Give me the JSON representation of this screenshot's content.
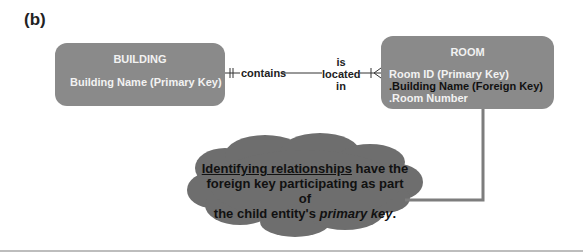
{
  "figure_label": "(b)",
  "entities": {
    "building": {
      "title": "BUILDING",
      "attributes": [
        "Building Name (Primary Key)"
      ]
    },
    "room": {
      "title": "ROOM",
      "attributes": [
        "Room ID (Primary Key)",
        ".Building Name (Foreign Key)",
        ".Room Number"
      ]
    }
  },
  "relationship": {
    "forward_label": "contains",
    "reverse_label_lines": [
      "is",
      "located",
      "in"
    ],
    "building_cardinality": "one-and-only-one",
    "room_cardinality": "one-or-many"
  },
  "callout": {
    "underlined": "Identifying relationships",
    "line1_rest": " have the",
    "line2": "foreign key participating as part of",
    "line3_start": "the child entity's ",
    "line3_italic": "primary key",
    "line3_end": "."
  },
  "colors": {
    "entity_fill": "#8a8a8a",
    "cloud_fill": "#6e6e6e",
    "arrow": "#7d7d7d"
  }
}
